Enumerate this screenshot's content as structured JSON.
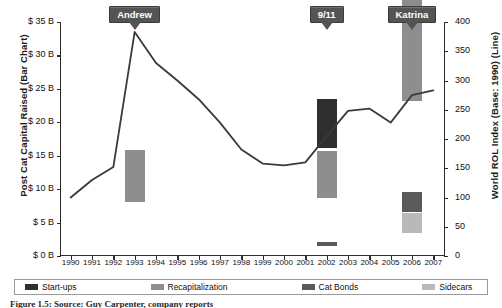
{
  "chart_data": {
    "type": "bar",
    "title": "",
    "subtitle": "",
    "xlabel": "",
    "ylabel": "Post Cat Capital Raised (Bar Chart)",
    "y2label": "World ROL Index (Base: 1990) (Line)",
    "grid": false,
    "legend_position": "bottom",
    "categories": [
      "1990",
      "1991",
      "1992",
      "1993",
      "1994",
      "1995",
      "1996",
      "1997",
      "1998",
      "1999",
      "2000",
      "2001",
      "2002",
      "2003",
      "2004",
      "2005",
      "2006",
      "2007"
    ],
    "ylim": [
      0,
      35
    ],
    "ytick_labels": [
      "$ 0 B",
      "$ 5 B",
      "$ 10 B",
      "$ 15 B",
      "$ 20 B",
      "$ 25 B",
      "$ 30 B",
      "$ 35 B"
    ],
    "ytick_values": [
      0,
      5,
      10,
      15,
      20,
      25,
      30,
      35
    ],
    "y2lim": [
      0,
      400
    ],
    "y2tick_labels": [
      "0",
      "50",
      "100",
      "150",
      "200",
      "250",
      "300",
      "350",
      "400"
    ],
    "y2tick_values": [
      0,
      50,
      100,
      150,
      200,
      250,
      300,
      350,
      400
    ],
    "bar_unit": "billion USD",
    "series": [
      {
        "name": "Start-ups",
        "type": "bar",
        "color": "#2f2f2f",
        "stack": "capital",
        "values": [
          0,
          0,
          0,
          2.5,
          0,
          0,
          0,
          0,
          0,
          0,
          0,
          0,
          7.5,
          0,
          0,
          0,
          11.0,
          0
        ]
      },
      {
        "name": "Recapitalization",
        "type": "bar",
        "color": "#8e8e8e",
        "stack": "capital",
        "values": [
          0,
          0,
          0,
          8.0,
          0,
          0,
          0,
          0,
          0,
          0,
          0,
          0,
          7.3,
          0,
          0,
          0,
          16.5,
          0
        ]
      },
      {
        "name": "Cat Bonds",
        "type": "bar",
        "color": "#5a5a5a",
        "stack": "capital",
        "values": [
          0,
          0,
          0,
          0,
          0,
          0,
          0,
          0,
          0,
          0,
          0,
          0,
          1.0,
          0,
          0,
          0,
          3.2,
          0
        ]
      },
      {
        "name": "Sidecars",
        "type": "bar",
        "color": "#b9b9b9",
        "stack": "capital",
        "values": [
          0,
          0,
          0,
          0,
          0,
          0,
          0,
          0,
          0,
          0,
          0,
          0,
          0.3,
          0,
          0,
          0,
          3.3,
          0
        ]
      },
      {
        "name": "World ROL Index",
        "type": "line",
        "color": "#3a3a3a",
        "axis": "y2",
        "values": [
          100,
          130,
          152,
          383,
          330,
          300,
          268,
          228,
          182,
          158,
          155,
          160,
          205,
          248,
          252,
          228,
          275,
          283
        ]
      }
    ],
    "annotations": [
      {
        "label": "Andrew",
        "year": "1993",
        "points_to": "line-peak"
      },
      {
        "label": "9/11",
        "year": "2002",
        "points_to": "line"
      },
      {
        "label": "Katrina",
        "year": "2006",
        "points_to": "line"
      }
    ]
  },
  "legend": {
    "items": [
      {
        "label": "Start-ups",
        "marker": "swatch",
        "color": "#2f2f2f"
      },
      {
        "label": "Recapitalization",
        "marker": "swatch",
        "color": "#8e8e8e"
      },
      {
        "label": "Cat Bonds",
        "marker": "swatch",
        "color": "#5a5a5a"
      },
      {
        "label": "Sidecars",
        "marker": "swatch",
        "color": "#b9b9b9"
      },
      {
        "label": "World ROL Index",
        "marker": "line",
        "color": "#3a3a3a"
      }
    ]
  },
  "caption": {
    "text": "Figure 1.5: Source: Guy Carpenter, company reports"
  }
}
